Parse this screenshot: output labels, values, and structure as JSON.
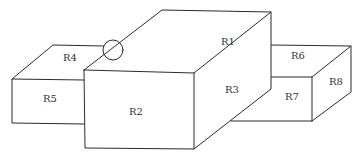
{
  "diagram": {
    "type": "3d-block-region-diagram",
    "colors": {
      "stroke": "#2a2a2a",
      "label": "#333333",
      "background": "#ffffff"
    },
    "regions": [
      {
        "id": "R1",
        "label": "R1",
        "face": "top of central tall block"
      },
      {
        "id": "R2",
        "label": "R2",
        "face": "front of central tall block"
      },
      {
        "id": "R3",
        "label": "R3",
        "face": "right side of central tall block"
      },
      {
        "id": "R4",
        "label": "R4",
        "face": "top of left low block"
      },
      {
        "id": "R5",
        "label": "R5",
        "face": "front of left low block"
      },
      {
        "id": "R6",
        "label": "R6",
        "face": "top of right low block"
      },
      {
        "id": "R7",
        "label": "R7",
        "face": "front of right low block"
      },
      {
        "id": "R8",
        "label": "R8",
        "face": "right side of right low block"
      }
    ],
    "annotations": [
      {
        "type": "circle",
        "description": "junction marker where R4 edge meets R1/R2 edge"
      }
    ]
  }
}
